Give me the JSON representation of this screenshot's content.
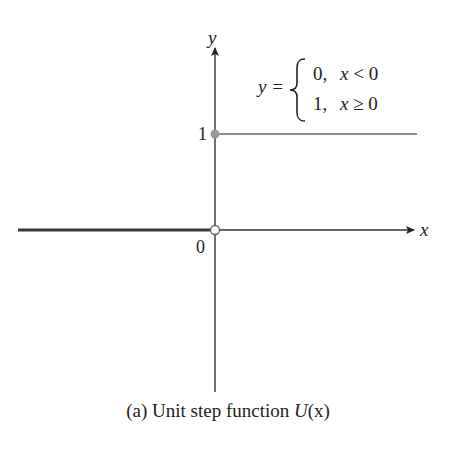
{
  "figure": {
    "caption_prefix": "(a) Unit step function ",
    "caption_func": "U",
    "caption_arg": "(x)",
    "axes": {
      "x_label": "x",
      "y_label": "y",
      "origin_label": "0",
      "y_tick_label": "1"
    },
    "equation": {
      "lhs": "y =",
      "case1_value": "0,",
      "case1_condition": "x < 0",
      "case2_value": "1,",
      "case2_condition": "x ≥ 0"
    },
    "colors": {
      "axis": "#333333",
      "left_segment": "#3a3a3a",
      "right_segment": "#8c8c8c",
      "filled_dot": "#999999",
      "open_dot_stroke": "#666666"
    }
  },
  "chart_data": {
    "type": "line",
    "title": "(a) Unit step function U(x)",
    "xlabel": "x",
    "ylabel": "y",
    "series": [
      {
        "name": "U(x), x<0",
        "x": [
          -1,
          0
        ],
        "y": [
          0,
          0
        ],
        "endpoint": "open at (0,0)"
      },
      {
        "name": "U(x), x≥0",
        "x": [
          0,
          1
        ],
        "y": [
          1,
          1
        ],
        "endpoint": "closed at (0,1)"
      }
    ],
    "y_ticks": [
      1
    ],
    "x_ticks": [
      0
    ],
    "annotations": [
      "y = { 0, x < 0 ; 1, x ≥ 0 }"
    ],
    "grid": false
  }
}
